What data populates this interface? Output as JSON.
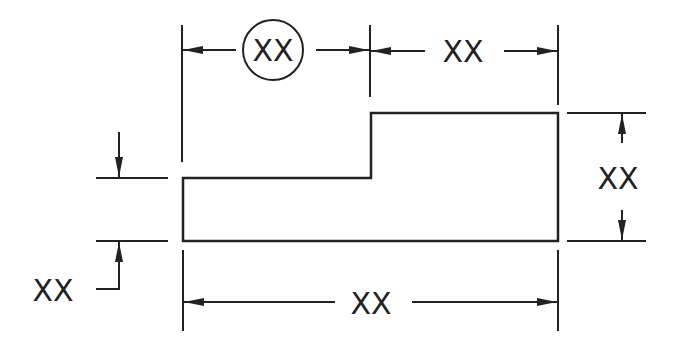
{
  "diagram": {
    "type": "dimensioned-drawing",
    "stroke_color": "#222222",
    "background": "#ffffff",
    "dimensions": {
      "top_left_width": {
        "label": "XX",
        "circled": true
      },
      "top_right_width": {
        "label": "XX",
        "circled": false
      },
      "right_height": {
        "label": "XX"
      },
      "left_step_height": {
        "label": "XX"
      },
      "bottom_total_width": {
        "label": "XX"
      }
    }
  }
}
